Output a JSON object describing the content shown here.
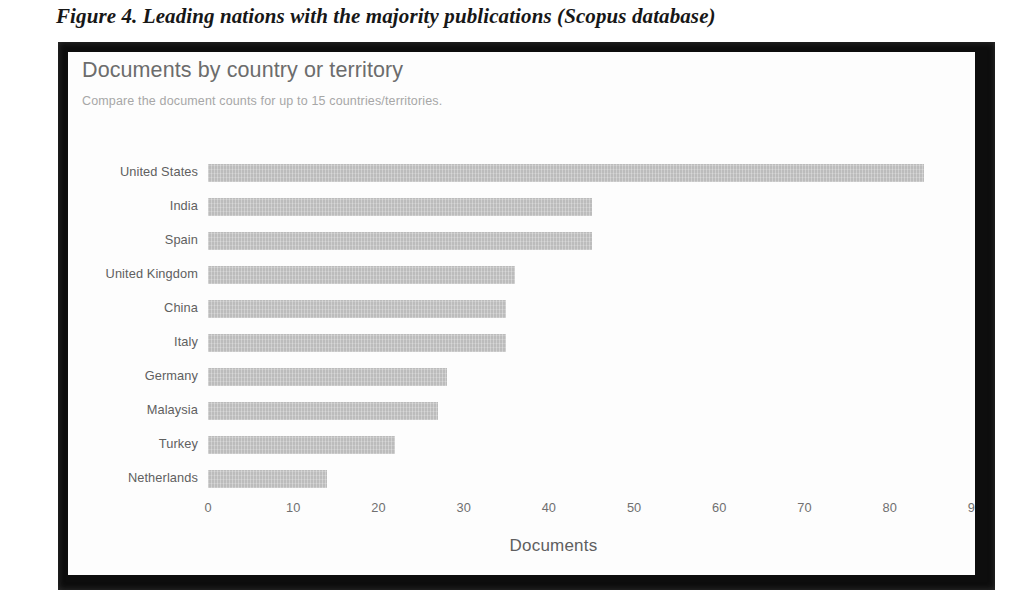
{
  "figure": {
    "caption": "Figure 4. Leading nations with the majority publications (Scopus database)"
  },
  "chart_panel": {
    "title": "Documents by country or territory",
    "subtitle": "Compare the document counts for up to 15 countries/territories.",
    "frame_color": "#0d0d0d",
    "card_background": "#fdfdfd",
    "bar_color": "#bcbcbc",
    "title_color": "#6c6c6c",
    "label_color": "#606060"
  },
  "chart_data": {
    "type": "bar",
    "orientation": "horizontal",
    "title": "Documents by country or territory",
    "subtitle": "Compare the document counts for up to 15 countries/territories.",
    "xlabel": "Documents",
    "ylabel": "",
    "xlim": [
      0,
      90
    ],
    "xticks": [
      0,
      10,
      20,
      30,
      40,
      50,
      60,
      70,
      80,
      90
    ],
    "xtick_labels": [
      "0",
      "10",
      "20",
      "30",
      "40",
      "50",
      "60",
      "70",
      "80",
      "90"
    ],
    "grid": false,
    "legend": null,
    "categories": [
      "United States",
      "India",
      "Spain",
      "United Kingdom",
      "China",
      "Italy",
      "Germany",
      "Malaysia",
      "Turkey",
      "Netherlands"
    ],
    "values": [
      84,
      45,
      45,
      36,
      35,
      35,
      28,
      27,
      22,
      14
    ],
    "series": [
      {
        "name": "Documents",
        "values": [
          84,
          45,
          45,
          36,
          35,
          35,
          28,
          27,
          22,
          14
        ]
      }
    ]
  }
}
